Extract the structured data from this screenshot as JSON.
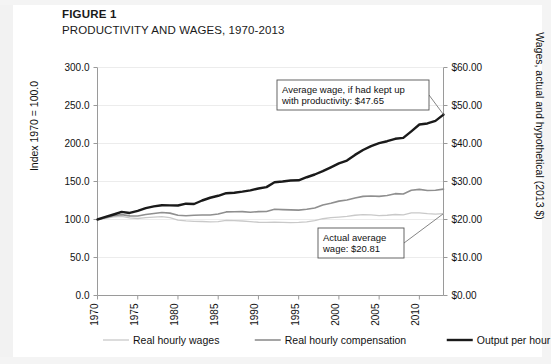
{
  "figure": {
    "label": "FIGURE 1",
    "title": "PRODUCTIVITY AND WAGES, 1970-2013"
  },
  "axes": {
    "y_left_title": "Index 1970 = 100.0",
    "y_right_title": "Wages, actual and hypothetical (2013 $)",
    "y_left_ticks": [
      "0.0",
      "50.0",
      "100.0",
      "150.0",
      "200.0",
      "250.0",
      "300.0"
    ],
    "y_right_ticks": [
      "$0.00",
      "$10.00",
      "$20.00",
      "$30.00",
      "$40.00",
      "$50.00",
      "$60.00"
    ],
    "x_ticks": [
      "1970",
      "1975",
      "1980",
      "1985",
      "1990",
      "1995",
      "2000",
      "2005",
      "2010"
    ]
  },
  "annotations": [
    {
      "name": "hypothetical-wage-callout",
      "line1": "Average wage, if had kept up",
      "line2": "with productivity: $47.65"
    },
    {
      "name": "actual-wage-callout",
      "line1": "Actual average",
      "line2": "wage: $20.81"
    }
  ],
  "legend": {
    "items": [
      {
        "label": "Real hourly wages",
        "color": "#c9c9c9",
        "width": 1.3
      },
      {
        "label": "Real hourly compensation",
        "color": "#8f8f8f",
        "width": 1.6
      },
      {
        "label": "Output per hour",
        "color": "#1a1a1a",
        "width": 2.4
      }
    ]
  },
  "colors": {
    "gridline": "#ececec",
    "axis": "#9a9a9a",
    "text": "#111111",
    "callout_border": "#555555",
    "background": "#ffffff"
  },
  "chart_data": {
    "type": "line",
    "title": "PRODUCTIVITY AND WAGES, 1970-2013",
    "xlabel": "",
    "ylabel": "Index 1970 = 100.0",
    "ylabel_right": "Wages, actual and hypothetical (2013 $)",
    "xlim": [
      1970,
      2013
    ],
    "ylim": [
      0,
      300
    ],
    "ylim_right": [
      0,
      60
    ],
    "grid": true,
    "legend_position": "bottom",
    "x": [
      1970,
      1971,
      1972,
      1973,
      1974,
      1975,
      1976,
      1977,
      1978,
      1979,
      1980,
      1981,
      1982,
      1983,
      1984,
      1985,
      1986,
      1987,
      1988,
      1989,
      1990,
      1991,
      1992,
      1993,
      1994,
      1995,
      1996,
      1997,
      1998,
      1999,
      2000,
      2001,
      2002,
      2003,
      2004,
      2005,
      2006,
      2007,
      2008,
      2009,
      2010,
      2011,
      2012,
      2013
    ],
    "series": [
      {
        "name": "Real hourly wages",
        "color": "#c9c9c9",
        "values": [
          100.0,
          101.5,
          103.4,
          104.2,
          102.1,
          101.3,
          102.5,
          103.2,
          103.8,
          102.4,
          99.2,
          98.1,
          97.6,
          97.4,
          97.0,
          97.2,
          98.8,
          98.4,
          98.0,
          97.2,
          96.4,
          96.2,
          96.6,
          96.2,
          96.0,
          96.2,
          97.0,
          98.6,
          101.0,
          102.4,
          103.2,
          104.2,
          105.6,
          106.4,
          106.0,
          105.2,
          105.6,
          106.6,
          106.2,
          108.6,
          108.8,
          107.6,
          107.2,
          107.8
        ]
      },
      {
        "name": "Real hourly compensation",
        "color": "#8f8f8f",
        "values": [
          100.0,
          102.2,
          105.0,
          106.4,
          104.8,
          104.6,
          106.6,
          108.0,
          109.2,
          108.4,
          105.6,
          105.0,
          105.6,
          106.0,
          106.0,
          107.2,
          110.0,
          110.2,
          110.4,
          109.6,
          110.4,
          110.6,
          113.4,
          113.0,
          112.6,
          112.4,
          113.4,
          115.2,
          119.2,
          121.4,
          124.2,
          125.6,
          128.2,
          130.4,
          131.0,
          130.4,
          131.6,
          134.0,
          133.6,
          138.4,
          139.6,
          138.2,
          138.4,
          140.0
        ]
      },
      {
        "name": "Output per hour",
        "color": "#1a1a1a",
        "values": [
          100.0,
          103.4,
          106.6,
          110.0,
          108.6,
          111.4,
          115.0,
          117.2,
          118.8,
          118.6,
          118.4,
          120.8,
          120.4,
          125.0,
          128.6,
          131.2,
          134.6,
          135.2,
          136.6,
          138.4,
          140.8,
          142.6,
          149.0,
          150.0,
          151.4,
          151.6,
          155.6,
          159.2,
          163.6,
          168.6,
          173.8,
          177.6,
          185.0,
          191.4,
          196.6,
          200.4,
          203.0,
          206.2,
          207.4,
          216.0,
          225.0,
          226.4,
          229.8,
          238.0
        ]
      }
    ],
    "annotations": [
      {
        "text": "Average wage, if had kept up with productivity: $47.65",
        "points_to_series": "Output per hour",
        "points_to_x": 2013,
        "value": 47.65
      },
      {
        "text": "Actual average wage: $20.81",
        "points_to_series": "Real hourly wages",
        "points_to_x": 2013,
        "value": 20.81
      }
    ]
  }
}
